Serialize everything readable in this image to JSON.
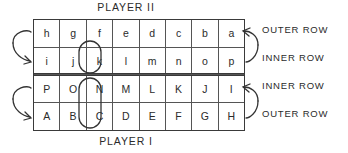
{
  "figure": {
    "title_top": "PLAYER II",
    "title_bottom": "PLAYER I"
  },
  "board": {
    "columns": 8,
    "rows": [
      {
        "id": "outer-upper",
        "owner": "PLAYER II",
        "label": "OUTER ROW",
        "cells": [
          "h",
          "g",
          "f",
          "e",
          "d",
          "c",
          "b",
          "a"
        ]
      },
      {
        "id": "inner-upper",
        "owner": "PLAYER II",
        "label": "INNER ROW",
        "cells": [
          "i",
          "j",
          "k",
          "l",
          "m",
          "n",
          "o",
          "p"
        ]
      },
      {
        "id": "inner-lower",
        "owner": "PLAYER I",
        "label": "INNER ROW",
        "cells": [
          "P",
          "O",
          "N",
          "M",
          "L",
          "K",
          "J",
          "I"
        ]
      },
      {
        "id": "outer-lower",
        "owner": "PLAYER I",
        "label": "OUTER ROW",
        "cells": [
          "A",
          "B",
          "C",
          "D",
          "E",
          "F",
          "G",
          "H"
        ]
      }
    ]
  },
  "row_labels": {
    "outer_top": "OUTER ROW",
    "inner_top": "INNER ROW",
    "inner_bottom": "INNER ROW",
    "outer_bottom": "OUTER ROW"
  },
  "highlights": [
    {
      "name": "highlight-k",
      "cells": [
        "k"
      ],
      "shape": "oval"
    },
    {
      "name": "highlight-n-c",
      "cells": [
        "N",
        "C"
      ],
      "shape": "oval"
    }
  ],
  "arrows": [
    {
      "name": "arrow-upper-left",
      "from": "h",
      "to": "i",
      "direction": "outer-to-inner"
    },
    {
      "name": "arrow-upper-right",
      "from": "p",
      "to": "a",
      "direction": "inner-to-outer"
    },
    {
      "name": "arrow-lower-left",
      "from": "P",
      "to": "A",
      "direction": "inner-to-outer"
    },
    {
      "name": "arrow-lower-right",
      "from": "H",
      "to": "I",
      "direction": "outer-to-inner"
    }
  ],
  "colors": {
    "ink": "#2b2b2b",
    "rule": "#555555",
    "border": "#3a3a3a",
    "background": "#ffffff"
  }
}
